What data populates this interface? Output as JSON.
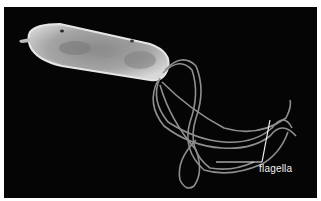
{
  "figure": {
    "annotation_label": "flagella",
    "colors": {
      "background": "#050505",
      "border": "#ffffff",
      "cell_body": "#b8b8b8",
      "flagella": "#9a9a9a",
      "annotation": "#f2f2f2"
    }
  }
}
